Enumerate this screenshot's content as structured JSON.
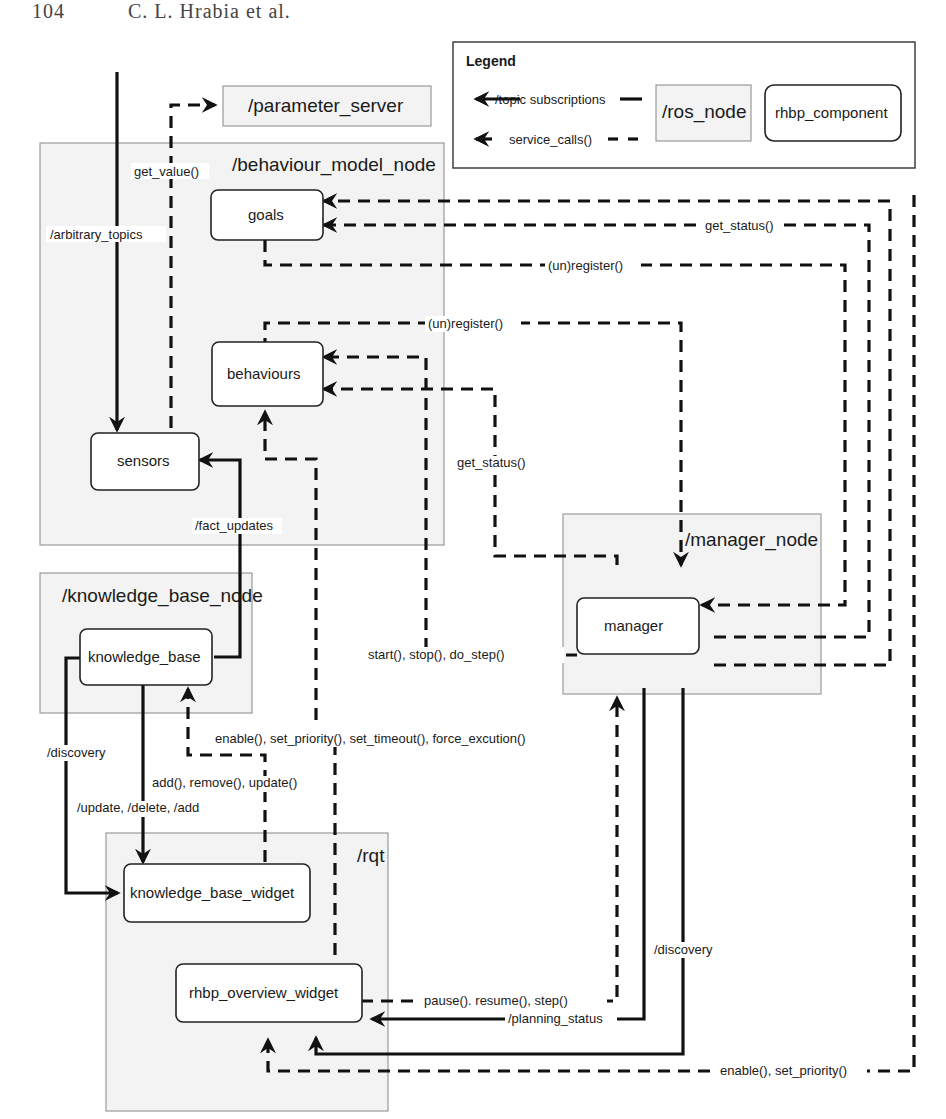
{
  "page_header": {
    "page_number": "104",
    "authors": "C. L. Hrabia et al."
  },
  "legend": {
    "title": "Legend",
    "topic_label": "/topic subscriptions",
    "service_label": "service_calls()",
    "ros_node_label": "/ros_node",
    "component_label": "rhbp_component"
  },
  "nodes": {
    "parameter_server": "/parameter_server",
    "behaviour_model_node": "/behaviour_model_node",
    "knowledge_base_node": "/knowledge_base_node",
    "manager_node": "/manager_node",
    "rqt": "/rqt"
  },
  "components": {
    "goals": "goals",
    "behaviours": "behaviours",
    "sensors": "sensors",
    "knowledge_base": "knowledge_base",
    "manager": "manager",
    "knowledge_base_widget": "knowledge_base_widget",
    "rhbp_overview_widget": "rhbp_overview_widget"
  },
  "edges": {
    "arbitrary_topics": "/arbitrary_topics",
    "get_value": "get_value()",
    "goals_get_status": "get_status()",
    "goals_unregister": "(un)register()",
    "behaviours_unregister": "(un)register()",
    "behaviours_get_status": "get_status()",
    "fact_updates": "/fact_updates",
    "start_stop": "start(), stop(), do_step()",
    "discovery_kb": "/discovery",
    "kb_topics": "/update, /delete, /add",
    "kb_services": "add(), remove(), update()",
    "behaviour_services": "enable(), set_priority(), set_timeout(), force_excution()",
    "pause_resume": "pause(). resume(), step()",
    "planning_status": "/planning_status",
    "discovery_manager": "/discovery",
    "enable_set_priority": "enable(), set_priority()"
  },
  "colors": {
    "line": "#111111",
    "node_fill": "#f3f3f3",
    "node_border": "#9a9a9a",
    "component_fill": "#ffffff"
  }
}
